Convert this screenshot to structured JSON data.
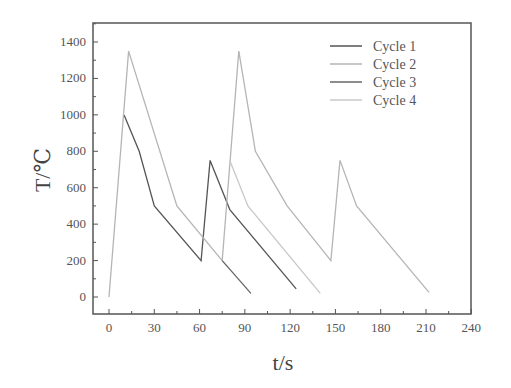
{
  "chart_data": {
    "type": "line",
    "title": "",
    "xlabel": "t/s",
    "ylabel": "T/℃",
    "xlim": [
      -8,
      240
    ],
    "ylim": [
      -100,
      1500
    ],
    "x_ticks": [
      0,
      30,
      60,
      90,
      120,
      150,
      180,
      210,
      240
    ],
    "y_ticks": [
      0,
      200,
      400,
      600,
      800,
      1000,
      1200,
      1400
    ],
    "grid": false,
    "legend_position": "upper right",
    "series": [
      {
        "name": "Cycle 1",
        "color": "#555555",
        "points": [
          [
            10,
            1000
          ],
          [
            20,
            800
          ],
          [
            30,
            500
          ],
          [
            61,
            200
          ],
          [
            67,
            750
          ],
          [
            80,
            480
          ],
          [
            124,
            45
          ]
        ]
      },
      {
        "name": "Cycle 2",
        "color": "#b5b5b5",
        "points": [
          [
            0,
            0
          ],
          [
            13,
            1350
          ],
          [
            45,
            500
          ],
          [
            75,
            200
          ],
          [
            86,
            1350
          ],
          [
            97,
            800
          ],
          [
            118,
            500
          ],
          [
            147,
            200
          ],
          [
            153,
            750
          ],
          [
            164,
            500
          ],
          [
            212,
            25
          ]
        ]
      },
      {
        "name": "Cycle 3",
        "color": "#666666",
        "points": [
          [
            75,
            200
          ],
          [
            94,
            20
          ]
        ]
      },
      {
        "name": "Cycle 4",
        "color": "#c8c8c8",
        "points": [
          [
            80,
            750
          ],
          [
            92,
            500
          ],
          [
            140,
            20
          ]
        ]
      }
    ]
  }
}
